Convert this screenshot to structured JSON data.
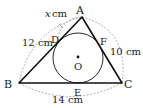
{
  "diagram": {
    "type": "geometry",
    "points": {
      "A": {
        "label": "A",
        "x": 82,
        "y": 17
      },
      "B": {
        "label": "B",
        "x": 19,
        "y": 83
      },
      "C": {
        "label": "C",
        "x": 122,
        "y": 83
      },
      "D": {
        "label": "D",
        "x": 58,
        "y": 38
      },
      "E": {
        "label": "E",
        "x": 78,
        "y": 83
      },
      "F": {
        "label": "F",
        "x": 100,
        "y": 40
      },
      "O": {
        "label": "O",
        "x": 78,
        "y": 58
      }
    },
    "circle": {
      "cx": 78,
      "cy": 58,
      "r": 25
    },
    "measurements": {
      "AD": "x cm",
      "AB": "12 cm",
      "AC": "10 cm",
      "BC": "14 cm"
    },
    "labels": {
      "x_var": "x",
      "x_unit": "cm",
      "ab": "12 cm",
      "ac": "10 cm",
      "bc": "14 cm",
      "A": "A",
      "B": "B",
      "C": "C",
      "D": "D",
      "E": "E",
      "F": "F",
      "O": "O"
    },
    "colors": {
      "line": "#111111",
      "dashed": "#999999",
      "text": "#222222"
    }
  }
}
